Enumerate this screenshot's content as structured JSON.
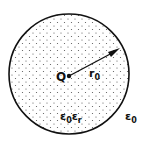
{
  "diagram": {
    "charge_label": "Q",
    "radius_label": "r",
    "radius_subscript": "0",
    "inner_medium_label": "ε",
    "inner_medium_sub1": "0",
    "inner_medium_label2": "ε",
    "inner_medium_sub2": "r",
    "outer_medium_label": "ε",
    "outer_medium_sub": "0",
    "colors": {
      "stroke": "#111111",
      "background": "#ffffff",
      "dots": "#555555"
    }
  }
}
